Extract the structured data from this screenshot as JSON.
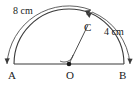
{
  "figure": {
    "type": "geometry-diagram",
    "stroke_color": "#3a3a3a",
    "text_color": "#1a1a1a",
    "background_color": "#ffffff"
  },
  "points": {
    "a": {
      "label": "A"
    },
    "o": {
      "label": "O"
    },
    "b": {
      "label": "B"
    },
    "c": {
      "label": "C"
    }
  },
  "measurements": {
    "arc_left": {
      "label": "8 cm",
      "value": 8,
      "unit": "cm"
    },
    "arc_right": {
      "label": "4 cm",
      "value": 4,
      "unit": "cm"
    }
  }
}
